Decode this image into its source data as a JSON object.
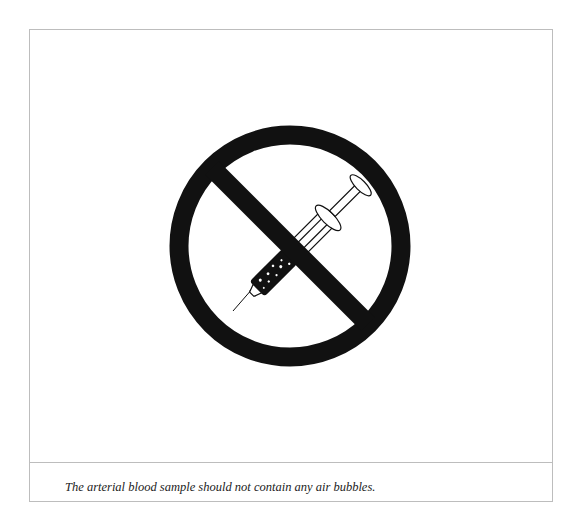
{
  "figure": {
    "icons": [
      "prohibition-sign-icon",
      "syringe-icon",
      "air-bubbles-icon"
    ],
    "colors": {
      "ink": "#111111",
      "border": "#bdbdbd",
      "background": "#ffffff"
    }
  },
  "caption": {
    "text": "The arterial blood sample should not contain any air bubbles."
  }
}
